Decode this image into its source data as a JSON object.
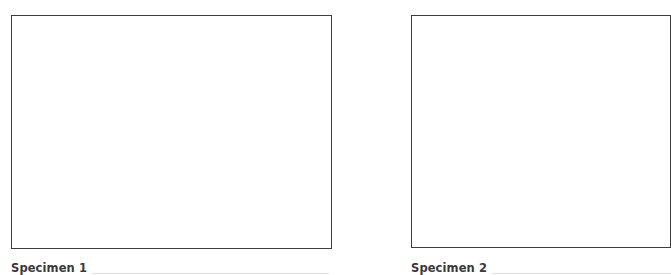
{
  "specimens": [
    {
      "label": "Specimen 1",
      "box": {
        "x": 11,
        "y": 15,
        "width": 321,
        "height": 234
      },
      "write_line": true
    },
    {
      "label": "Specimen 2",
      "box": {
        "x": 411,
        "y": 15,
        "width": 260,
        "height": 233
      },
      "write_line": true
    }
  ],
  "colors": {
    "border": "#3d3d3d",
    "label_text": "#3a3a3a",
    "write_line": "#e4dfe6",
    "background": "#ffffff"
  }
}
